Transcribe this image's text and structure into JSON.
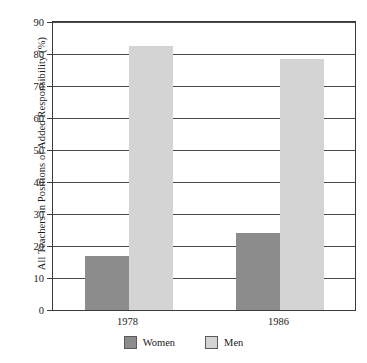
{
  "chart_data": {
    "type": "bar",
    "title": "",
    "xlabel": "",
    "ylabel": "All Teachers in Positions of Added Responsibility (%)",
    "categories": [
      "1978",
      "1986"
    ],
    "series": [
      {
        "name": "Women",
        "values": [
          17,
          24
        ],
        "color": "#8c8c8c"
      },
      {
        "name": "Men",
        "values": [
          82.5,
          78.5
        ],
        "color": "#d4d4d4"
      }
    ],
    "ylim": [
      0,
      90
    ],
    "yticks": [
      0,
      10,
      20,
      30,
      40,
      50,
      60,
      70,
      80,
      90
    ],
    "ytick_labels": [
      "0",
      "10",
      "20",
      "30",
      "40",
      "50",
      "60",
      "70",
      "80",
      "90"
    ],
    "grid": true,
    "legend_position": "bottom",
    "legend": [
      {
        "label": "Women",
        "color": "#8c8c8c"
      },
      {
        "label": "Men",
        "color": "#d4d4d4"
      }
    ]
  }
}
